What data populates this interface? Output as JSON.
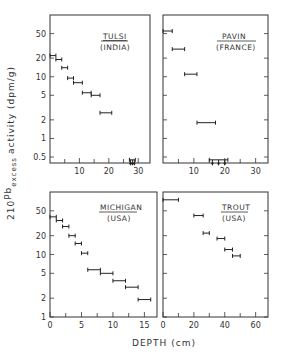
{
  "chart_data": [
    {
      "type": "scatter",
      "title": "TULSI (INDIA)",
      "xlabel": "DEPTH (cm)",
      "ylabel": "210Pb excess activity (dpm/g)",
      "yscale": "log",
      "xlim": [
        0,
        34
      ],
      "ylim": [
        0.4,
        100
      ],
      "xticks": [
        10,
        20,
        30
      ],
      "yticks": [
        "0.5",
        "1",
        "2",
        "5",
        "10",
        "20",
        "50"
      ],
      "points": [
        {
          "x0": 0,
          "x1": 2,
          "y": 22
        },
        {
          "x0": 2,
          "x1": 4,
          "y": 19
        },
        {
          "x0": 4,
          "x1": 6,
          "y": 14
        },
        {
          "x0": 6,
          "x1": 8,
          "y": 9.5
        },
        {
          "x0": 8,
          "x1": 11,
          "y": 8
        },
        {
          "x0": 11,
          "x1": 14,
          "y": 5.5
        },
        {
          "x0": 14,
          "x1": 17,
          "y": 5
        },
        {
          "x0": 17,
          "x1": 21,
          "y": 2.6
        },
        {
          "x0": 27,
          "x1": 29,
          "y": 0.45,
          "upper_limit": true
        }
      ]
    },
    {
      "type": "scatter",
      "title": "PAVIN (FRANCE)",
      "yscale": "log",
      "xlim": [
        0,
        34
      ],
      "ylim": [
        0.4,
        100
      ],
      "xticks": [
        10,
        20,
        30
      ],
      "points": [
        {
          "x0": 0,
          "x1": 3,
          "y": 55
        },
        {
          "x0": 3,
          "x1": 7,
          "y": 28
        },
        {
          "x0": 7,
          "x1": 11,
          "y": 11
        },
        {
          "x0": 11,
          "x1": 17,
          "y": 1.8
        },
        {
          "x0": 15,
          "x1": 21,
          "y": 0.45,
          "upper_limit": true
        }
      ]
    },
    {
      "type": "scatter",
      "title": "MICHIGAN (USA)",
      "yscale": "log",
      "xlim": [
        0,
        17
      ],
      "ylim": [
        1,
        100
      ],
      "xticks": [
        0,
        5,
        10,
        15
      ],
      "yticks": [
        "1",
        "2",
        "5",
        "10",
        "20",
        "50"
      ],
      "points": [
        {
          "x0": 0,
          "x1": 1,
          "y": 40
        },
        {
          "x0": 1,
          "x1": 2,
          "y": 35
        },
        {
          "x0": 2,
          "x1": 3,
          "y": 28
        },
        {
          "x0": 3,
          "x1": 4,
          "y": 20
        },
        {
          "x0": 4,
          "x1": 5,
          "y": 15
        },
        {
          "x0": 5,
          "x1": 6,
          "y": 10.5
        },
        {
          "x0": 6,
          "x1": 8,
          "y": 5.7
        },
        {
          "x0": 8,
          "x1": 10,
          "y": 5
        },
        {
          "x0": 10,
          "x1": 12,
          "y": 3.8
        },
        {
          "x0": 12,
          "x1": 14,
          "y": 3
        },
        {
          "x0": 14,
          "x1": 16,
          "y": 1.9
        }
      ]
    },
    {
      "type": "scatter",
      "title": "TROUT (USA)",
      "yscale": "log",
      "xlim": [
        0,
        68
      ],
      "ylim": [
        1,
        100
      ],
      "xticks": [
        0,
        20,
        40,
        60
      ],
      "points": [
        {
          "x0": 0,
          "x1": 10,
          "y": 75
        },
        {
          "x0": 20,
          "x1": 26,
          "y": 42
        },
        {
          "x0": 26,
          "x1": 30,
          "y": 22
        },
        {
          "x0": 35,
          "x1": 40,
          "y": 18
        },
        {
          "x0": 40,
          "x1": 45,
          "y": 12
        },
        {
          "x0": 45,
          "x1": 50,
          "y": 9.5
        }
      ]
    }
  ],
  "labels": {
    "ylabel_iso": "210",
    "ylabel_pb": "Pb",
    "ylabel_sub": "excess",
    "ylabel_rest": "activity (dpm/g)",
    "xlabel": "DEPTH (cm)",
    "tulsi_name": "TULSI",
    "tulsi_country": "(INDIA)",
    "pavin_name": "PAVIN",
    "pavin_country": "(FRANCE)",
    "michigan_name": "MICHIGAN",
    "michigan_country": "(USA)",
    "trout_name": "TROUT",
    "trout_country": "(USA)"
  }
}
